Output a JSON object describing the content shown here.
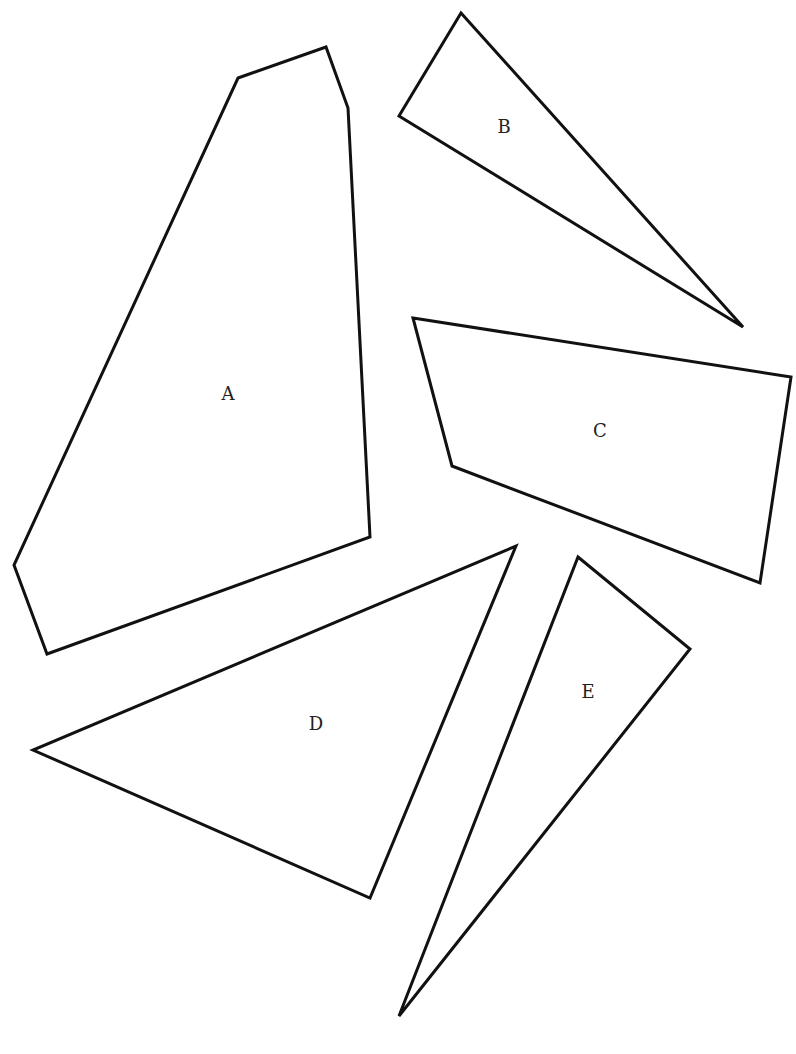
{
  "diagram": {
    "title": "",
    "background": "#ffffff",
    "stroke_color": "#111111",
    "shapes": [
      {
        "id": "A",
        "label": "A",
        "type": "hexagon",
        "points": [
          [
            238,
            78
          ],
          [
            326,
            47
          ],
          [
            348,
            108
          ],
          [
            370,
            537
          ],
          [
            47,
            654
          ],
          [
            14,
            565
          ]
        ],
        "label_pos": [
          228,
          395
        ]
      },
      {
        "id": "B",
        "label": "B",
        "type": "triangle",
        "points": [
          [
            461,
            13
          ],
          [
            743,
            327
          ],
          [
            399,
            116
          ]
        ],
        "label_pos": [
          504,
          128
        ]
      },
      {
        "id": "C",
        "label": "C",
        "type": "quadrilateral",
        "points": [
          [
            413,
            318
          ],
          [
            791,
            377
          ],
          [
            760,
            583
          ],
          [
            452,
            466
          ]
        ],
        "label_pos": [
          600,
          432
        ]
      },
      {
        "id": "D",
        "label": "D",
        "type": "triangle",
        "points": [
          [
            516,
            546
          ],
          [
            370,
            898
          ],
          [
            33,
            750
          ]
        ],
        "label_pos": [
          316,
          725
        ]
      },
      {
        "id": "E",
        "label": "E",
        "type": "triangle",
        "points": [
          [
            578,
            557
          ],
          [
            690,
            649
          ],
          [
            399,
            1016
          ]
        ],
        "label_pos": [
          588,
          693
        ]
      }
    ]
  }
}
